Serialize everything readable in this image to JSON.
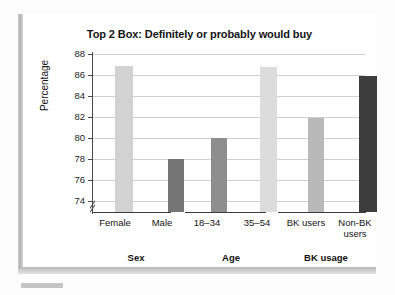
{
  "chart_data": {
    "type": "bar",
    "title": "Top 2 Box: Definitely or probably would buy",
    "xlabel": "",
    "ylabel": "Percentage",
    "ylim": [
      73,
      88
    ],
    "yticks": [
      74,
      76,
      78,
      80,
      82,
      84,
      86,
      88
    ],
    "axis_break": true,
    "grid": true,
    "legend": "none",
    "categories": [
      "Female",
      "Male",
      "18–34",
      "35–54",
      "BK users",
      "Non-BK users"
    ],
    "values": [
      86.9,
      78.0,
      80.0,
      86.8,
      81.9,
      85.9
    ],
    "bar_colors": [
      "#d2d2d2",
      "#757575",
      "#8e8e8e",
      "#dcdcdc",
      "#b9b9b9",
      "#3d3d3d"
    ],
    "groups": [
      {
        "label": "Sex",
        "categories": [
          "Female",
          "Male"
        ]
      },
      {
        "label": "Age",
        "categories": [
          "18–34",
          "35–54"
        ]
      },
      {
        "label": "BK usage",
        "categories": [
          "BK users",
          "Non-BK users"
        ]
      }
    ]
  },
  "chart": {
    "title": "Top 2 Box: Definitely or probably would buy",
    "y_axis_title": "Percentage",
    "y_ticks": [
      "88",
      "86",
      "84",
      "82",
      "80",
      "78",
      "76",
      "74"
    ],
    "bars": [
      {
        "label": "Female",
        "value": 86.9,
        "color": "#d2d2d2"
      },
      {
        "label": "Male",
        "value": 78.0,
        "color": "#757575"
      },
      {
        "label": "18–34",
        "value": 80.0,
        "color": "#8e8e8e"
      },
      {
        "label": "35–54",
        "value": 86.8,
        "color": "#dcdcdc"
      },
      {
        "label": "BK users",
        "value": 81.9,
        "color": "#b9b9b9"
      },
      {
        "label": "Non-BK\nusers",
        "value": 85.9,
        "color": "#3d3d3d"
      }
    ],
    "bar_labels": {
      "b0": "Female",
      "b1": "Male",
      "b2": "18–34",
      "b3": "35–54",
      "b4": "BK users",
      "b5_line1": "Non-BK",
      "b5_line2": "users"
    },
    "group_labels": {
      "g0": "Sex",
      "g1": "Age",
      "g2": "BK usage"
    }
  }
}
